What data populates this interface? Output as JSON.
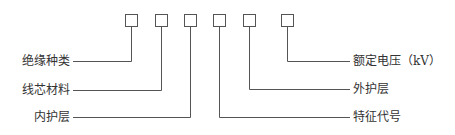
{
  "diagram": {
    "left_labels": [
      {
        "text": "绝缘种类",
        "box": 1
      },
      {
        "text": "线芯材料",
        "box": 2
      },
      {
        "text": "内护层",
        "box": 3
      }
    ],
    "right_labels": [
      {
        "text": "额定电压（kV）",
        "box": 6
      },
      {
        "text": "外护层",
        "box": 5
      },
      {
        "text": "特征代号",
        "box": 4
      }
    ],
    "boxes": 6,
    "colors": {
      "line": "#555555",
      "text": "#333333"
    }
  }
}
